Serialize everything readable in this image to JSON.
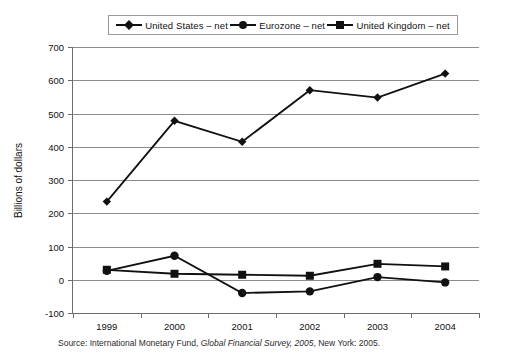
{
  "chart_data": {
    "type": "line",
    "title": "",
    "xlabel": "",
    "ylabel": "Billions of dollars",
    "x": [
      "1999",
      "2000",
      "2001",
      "2002",
      "2003",
      "2004"
    ],
    "categories": [
      "1999",
      "2000",
      "2001",
      "2002",
      "2003",
      "2004"
    ],
    "ylim": [
      -100,
      700
    ],
    "ytick_values": [
      700,
      600,
      500,
      400,
      300,
      200,
      100,
      0,
      -100
    ],
    "ytick_labels": [
      "700",
      "600",
      "500",
      "400",
      "300",
      "200",
      "100",
      "0",
      "-100"
    ],
    "grid": true,
    "legend_position": "top",
    "series": [
      {
        "name": "United States – net",
        "marker": "diamond",
        "color": "#111111",
        "values": [
          235,
          478,
          415,
          570,
          548,
          620
        ]
      },
      {
        "name": "Eurozone – net",
        "marker": "circle",
        "color": "#111111",
        "values": [
          27,
          72,
          -40,
          -35,
          8,
          -8
        ]
      },
      {
        "name": "United Kingdom – net",
        "marker": "square",
        "color": "#111111",
        "values": [
          30,
          18,
          15,
          12,
          48,
          40
        ]
      }
    ]
  },
  "legend": {
    "items": [
      {
        "label": "United States – net",
        "marker": "diamond"
      },
      {
        "label": "Eurozone – net",
        "marker": "circle"
      },
      {
        "label": "United Kingdom – net",
        "marker": "square"
      }
    ]
  },
  "axes": {
    "y_title": "Billions of dollars"
  },
  "source": {
    "prefix": "Source: International Monetary Fund, ",
    "italic": "Global Financial Survey, 2005",
    "suffix": ", New York: 2005."
  },
  "colors": {
    "line": "#111111",
    "grid": "#8c8c8c",
    "axis": "#6d6d6d",
    "background": "#ffffff"
  }
}
